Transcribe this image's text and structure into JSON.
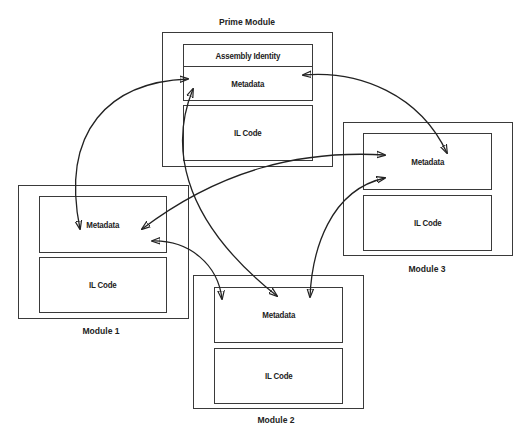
{
  "diagram": {
    "modules": [
      {
        "id": "prime",
        "caption": "Prime Module",
        "sections": [
          "Assembly Identity",
          "Metadata",
          "IL Code"
        ]
      },
      {
        "id": "module1",
        "caption": "Module 1",
        "sections": [
          "Metadata",
          "IL Code"
        ]
      },
      {
        "id": "module2",
        "caption": "Module 2",
        "sections": [
          "Metadata",
          "IL Code"
        ]
      },
      {
        "id": "module3",
        "caption": "Module 3",
        "sections": [
          "Metadata",
          "IL Code"
        ]
      }
    ],
    "connections": [
      {
        "from": "prime.Metadata",
        "to": "module1.Metadata",
        "type": "bidirectional"
      },
      {
        "from": "prime.Metadata",
        "to": "module3.Metadata",
        "type": "bidirectional"
      },
      {
        "from": "prime.Metadata",
        "to": "module2.Metadata",
        "type": "bidirectional"
      },
      {
        "from": "module1.Metadata",
        "to": "module3.Metadata",
        "type": "bidirectional"
      },
      {
        "from": "module1.Metadata",
        "to": "module2.Metadata",
        "type": "bidirectional"
      },
      {
        "from": "module3.Metadata",
        "to": "module2.Metadata",
        "type": "bidirectional"
      }
    ],
    "colors": {
      "stroke": "#222222",
      "background": "#ffffff"
    }
  }
}
